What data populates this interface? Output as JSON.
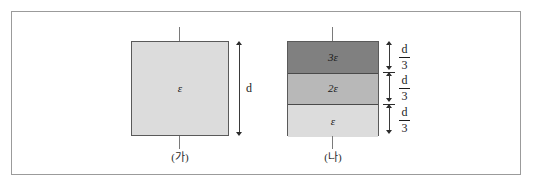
{
  "figure": {
    "background_color": "#ffffff",
    "frame_color": "#9b9b9b",
    "outline_color": "#5a5a5a"
  },
  "figure_a": {
    "caption": "(가)",
    "dimension_label": "d",
    "layers": [
      {
        "label": "ε",
        "fill": "#dcdcdc"
      }
    ]
  },
  "figure_b": {
    "caption": "(나)",
    "layers": [
      {
        "label": "3ε",
        "fill": "#808080",
        "thickness_numerator": "d",
        "thickness_denominator": "3"
      },
      {
        "label": "2ε",
        "fill": "#b8b8b8",
        "thickness_numerator": "d",
        "thickness_denominator": "3"
      },
      {
        "label": "ε",
        "fill": "#dcdcdc",
        "thickness_numerator": "d",
        "thickness_denominator": "3"
      }
    ]
  }
}
